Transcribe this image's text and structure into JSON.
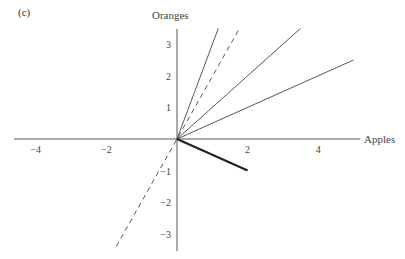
{
  "panel_label": "(c)",
  "chart_data": {
    "type": "line",
    "title": "",
    "xlabel": "Apples",
    "ylabel": "Oranges",
    "xlim": [
      -4.6,
      5.2
    ],
    "ylim": [
      -3.5,
      3.5
    ],
    "x_ticks": [
      -4,
      -2,
      2,
      4
    ],
    "y_ticks": [
      -3,
      -2,
      -1,
      1,
      2,
      3
    ],
    "x_tick_labels": [
      "−4",
      "−2",
      "2",
      "4"
    ],
    "y_tick_labels": [
      "−3",
      "−2",
      "−1",
      "1",
      "2",
      "3"
    ],
    "grid": false,
    "legend": null,
    "series": [
      {
        "name": "steep-solid-ray",
        "style": "solid",
        "x": [
          0,
          1.17
        ],
        "y": [
          0,
          3.5
        ]
      },
      {
        "name": "dashed-line",
        "style": "dashed",
        "x": [
          -1.72,
          1.77
        ],
        "y": [
          -3.4,
          3.5
        ]
      },
      {
        "name": "mid-solid-ray",
        "style": "solid",
        "x": [
          0,
          3.5
        ],
        "y": [
          0,
          3.5
        ]
      },
      {
        "name": "flat-solid-ray",
        "style": "solid",
        "x": [
          0,
          5.0
        ],
        "y": [
          0,
          2.5
        ]
      },
      {
        "name": "bold-vector",
        "style": "bold",
        "x": [
          0,
          2
        ],
        "y": [
          0,
          -1
        ]
      }
    ]
  }
}
